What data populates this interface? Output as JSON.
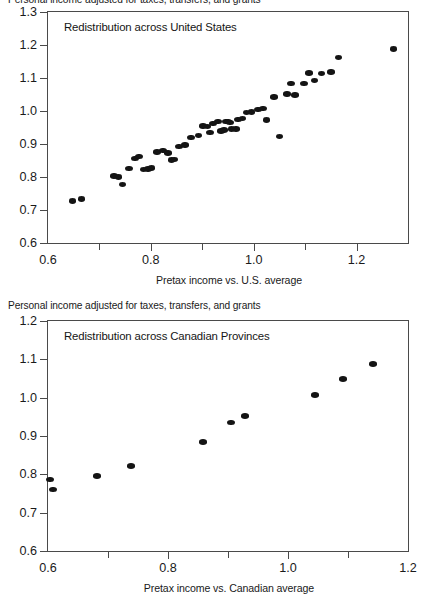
{
  "figure": {
    "background": "#ffffff",
    "point_color": "#141414",
    "axis_color": "#4a4a4a"
  },
  "panels": [
    {
      "id": "us",
      "axis_caption": "Personal income adjusted for taxes, transfers, and grants",
      "title": "Redistribution across United States",
      "xlabel": "Pretax income vs. U.S. average",
      "y_major_ticks": [
        "0.6",
        "0.7",
        "0.8",
        "0.9",
        "1.0",
        "1.1",
        "1.2",
        "1.3"
      ],
      "x_major_ticks": [
        "0.6",
        "0.8",
        "1.0",
        "1.2"
      ],
      "x_minor_ticks": [
        "0.7",
        "0.9",
        "1.1"
      ]
    },
    {
      "id": "canada",
      "axis_caption": "Personal income adjusted for taxes, transfers, and grants",
      "title": "Redistribution across Canadian Provinces",
      "xlabel": "Pretax income vs. Canadian average",
      "y_major_ticks": [
        "0.6",
        "0.7",
        "0.8",
        "0.9",
        "1.0",
        "1.1",
        "1.2"
      ],
      "x_major_ticks": [
        "0.6",
        "0.8",
        "1.0",
        "1.2"
      ],
      "x_minor_ticks": [
        "0.7",
        "0.9",
        "1.1"
      ]
    }
  ],
  "chart_data": [
    {
      "type": "scatter",
      "id": "us",
      "title": "Redistribution across United States",
      "xlabel": "Pretax income vs. U.S. average",
      "ylabel": "Personal income adjusted for taxes, transfers, and grants",
      "xlim": [
        0.6,
        1.3
      ],
      "ylim": [
        0.6,
        1.3
      ],
      "xticks": [
        0.6,
        0.7,
        0.8,
        0.9,
        1.0,
        1.1,
        1.2,
        1.3
      ],
      "xticklabels": [
        "0.6",
        "",
        "0.8",
        "",
        "1.0",
        "",
        "1.2",
        ""
      ],
      "yticks": [
        0.6,
        0.7,
        0.8,
        0.9,
        1.0,
        1.1,
        1.2,
        1.3
      ],
      "yticklabels": [
        "0.6",
        "0.7",
        "0.8",
        "0.9",
        "1.0",
        "1.1",
        "1.2",
        "1.3"
      ],
      "grid": false,
      "legend": null,
      "points": [
        [
          0.648,
          0.727
        ],
        [
          0.665,
          0.733
        ],
        [
          0.728,
          0.803
        ],
        [
          0.737,
          0.8
        ],
        [
          0.745,
          0.777
        ],
        [
          0.758,
          0.826
        ],
        [
          0.769,
          0.857
        ],
        [
          0.777,
          0.862
        ],
        [
          0.786,
          0.822
        ],
        [
          0.795,
          0.824
        ],
        [
          0.801,
          0.827
        ],
        [
          0.812,
          0.876
        ],
        [
          0.824,
          0.88
        ],
        [
          0.833,
          0.873
        ],
        [
          0.84,
          0.852
        ],
        [
          0.846,
          0.853
        ],
        [
          0.855,
          0.893
        ],
        [
          0.866,
          0.897
        ],
        [
          0.878,
          0.92
        ],
        [
          0.893,
          0.925
        ],
        [
          0.901,
          0.955
        ],
        [
          0.91,
          0.953
        ],
        [
          0.915,
          0.934
        ],
        [
          0.921,
          0.963
        ],
        [
          0.93,
          0.968
        ],
        [
          0.936,
          0.94
        ],
        [
          0.942,
          0.942
        ],
        [
          0.946,
          0.968
        ],
        [
          0.95,
          0.969
        ],
        [
          0.954,
          0.966
        ],
        [
          0.957,
          0.945
        ],
        [
          0.965,
          0.946
        ],
        [
          0.97,
          0.975
        ],
        [
          0.978,
          0.978
        ],
        [
          0.986,
          0.995
        ],
        [
          0.996,
          0.997
        ],
        [
          1.008,
          1.004
        ],
        [
          1.018,
          1.008
        ],
        [
          1.025,
          0.973
        ],
        [
          1.04,
          1.043
        ],
        [
          1.05,
          0.922
        ],
        [
          1.065,
          1.052
        ],
        [
          1.072,
          1.084
        ],
        [
          1.08,
          1.049
        ],
        [
          1.098,
          1.083
        ],
        [
          1.108,
          1.115
        ],
        [
          1.118,
          1.092
        ],
        [
          1.132,
          1.113
        ],
        [
          1.15,
          1.118
        ],
        [
          1.165,
          1.162
        ],
        [
          1.272,
          1.188
        ]
      ]
    },
    {
      "type": "scatter",
      "id": "canada",
      "title": "Redistribution across Canadian Provinces",
      "xlabel": "Pretax income vs. Canadian average",
      "ylabel": "Personal income adjusted for taxes, transfers, and grants",
      "xlim": [
        0.6,
        1.2
      ],
      "ylim": [
        0.6,
        1.2
      ],
      "xticks": [
        0.6,
        0.7,
        0.8,
        0.9,
        1.0,
        1.1,
        1.2
      ],
      "xticklabels": [
        "0.6",
        "",
        "0.8",
        "",
        "1.0",
        "",
        "1.2"
      ],
      "yticks": [
        0.6,
        0.7,
        0.8,
        0.9,
        1.0,
        1.1,
        1.2
      ],
      "yticklabels": [
        "0.6",
        "0.7",
        "0.8",
        "0.9",
        "1.0",
        "1.1",
        "1.2"
      ],
      "grid": false,
      "legend": null,
      "points": [
        [
          0.604,
          0.786
        ],
        [
          0.609,
          0.76
        ],
        [
          0.682,
          0.795
        ],
        [
          0.739,
          0.822
        ],
        [
          0.858,
          0.884
        ],
        [
          0.905,
          0.935
        ],
        [
          0.928,
          0.952
        ],
        [
          1.045,
          1.007
        ],
        [
          1.092,
          1.048
        ],
        [
          1.142,
          1.088
        ]
      ]
    }
  ]
}
